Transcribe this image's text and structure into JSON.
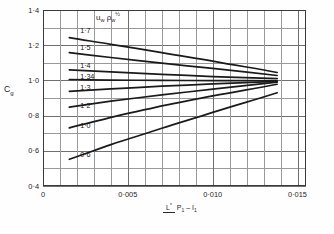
{
  "chart_data": {
    "type": "line",
    "title": "",
    "xlabel": "L* / (P1 - I1)",
    "ylabel": "Cg",
    "xlim": [
      0,
      0.0155
    ],
    "ylim": [
      0.4,
      1.4
    ],
    "grid": true,
    "legend_position": "inline-labels",
    "annotation": "u_w rho_w^1/2",
    "xticks": [
      {
        "value": 0,
        "label": "0"
      },
      {
        "value": 0.005,
        "label": "0·005"
      },
      {
        "value": 0.01,
        "label": "0·010"
      },
      {
        "value": 0.015,
        "label": "0·015"
      }
    ],
    "yticks": [
      {
        "value": 1.4,
        "label": "1·4"
      },
      {
        "value": 1.2,
        "label": "1·2"
      },
      {
        "value": 1.0,
        "label": "1·0"
      },
      {
        "value": 0.8,
        "label": "0·8"
      },
      {
        "value": 0.6,
        "label": "0·6"
      },
      {
        "value": 0.4,
        "label": "0·4"
      }
    ],
    "x_minor_step": 0.001,
    "y_minor_step": 0.1,
    "series": [
      {
        "name": "1·7",
        "label": "1·7",
        "label_x": 0.0022,
        "label_y": 1.283,
        "points": [
          [
            0.00155,
            1.243
          ],
          [
            0.004,
            1.205
          ],
          [
            0.007,
            1.158
          ],
          [
            0.01,
            1.11
          ],
          [
            0.0138,
            1.045
          ]
        ]
      },
      {
        "name": "1·5",
        "label": "1·5",
        "label_x": 0.0022,
        "label_y": 1.183,
        "points": [
          [
            0.00155,
            1.158
          ],
          [
            0.004,
            1.13
          ],
          [
            0.007,
            1.098
          ],
          [
            0.01,
            1.068
          ],
          [
            0.0138,
            1.028
          ]
        ]
      },
      {
        "name": "1·4",
        "label": "1·4",
        "label_x": 0.0022,
        "label_y": 1.082,
        "points": [
          [
            0.00155,
            1.06
          ],
          [
            0.004,
            1.048
          ],
          [
            0.007,
            1.034
          ],
          [
            0.01,
            1.022
          ],
          [
            0.0138,
            1.01
          ]
        ]
      },
      {
        "name": "1·34",
        "label": "1·34",
        "label_x": 0.0022,
        "label_y": 1.022,
        "points": [
          [
            0.00155,
            1.005
          ],
          [
            0.004,
            1.002
          ],
          [
            0.007,
            1.0
          ],
          [
            0.01,
            0.999
          ],
          [
            0.0138,
            0.998
          ]
        ]
      },
      {
        "name": "1·3",
        "label": "1·3",
        "label_x": 0.0022,
        "label_y": 0.955,
        "points": [
          [
            0.00155,
            0.938
          ],
          [
            0.004,
            0.952
          ],
          [
            0.007,
            0.967
          ],
          [
            0.01,
            0.98
          ],
          [
            0.0138,
            0.995
          ]
        ]
      },
      {
        "name": "1·2",
        "label": "1·2",
        "label_x": 0.0022,
        "label_y": 0.855,
        "points": [
          [
            0.00155,
            0.848
          ],
          [
            0.004,
            0.882
          ],
          [
            0.007,
            0.918
          ],
          [
            0.01,
            0.95
          ],
          [
            0.0138,
            0.99
          ]
        ]
      },
      {
        "name": "1·0",
        "label": "1·0",
        "label_x": 0.0022,
        "label_y": 0.74,
        "points": [
          [
            0.00155,
            0.73
          ],
          [
            0.004,
            0.79
          ],
          [
            0.007,
            0.855
          ],
          [
            0.01,
            0.912
          ],
          [
            0.0138,
            0.978
          ]
        ]
      },
      {
        "name": "0·6",
        "label": "0·6",
        "label_x": 0.0022,
        "label_y": 0.575,
        "points": [
          [
            0.00155,
            0.552
          ],
          [
            0.004,
            0.635
          ],
          [
            0.007,
            0.728
          ],
          [
            0.01,
            0.818
          ],
          [
            0.0138,
            0.93
          ]
        ]
      }
    ]
  },
  "axes": {
    "y_title_main": "C",
    "y_title_sub": "g",
    "x_title_numerator": "L",
    "x_title_numerator_sup": "*",
    "x_title_denom_a": "P",
    "x_title_denom_a_sub": "1",
    "x_title_denom_sep": " – ",
    "x_title_denom_b": "I",
    "x_title_denom_b_sub": "1"
  },
  "annotation": {
    "u_symbol": "u",
    "u_sub": "w",
    "rho_symbol": "ρ",
    "rho_sub": "w",
    "rho_sup": "½"
  },
  "colors": {
    "curve": "#1a1a1a",
    "grid": "#9a9a9a",
    "grid_major": "#6f6f6f",
    "frame": "#3a3a3a",
    "background": "#ffffff",
    "text": "#1f1f1f"
  }
}
